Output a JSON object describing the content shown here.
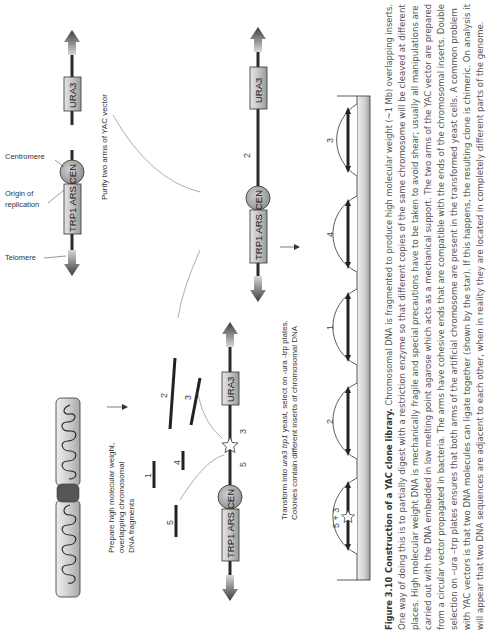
{
  "figure": {
    "caption_label": "Figure 3.10",
    "caption_title": "Construction of a YAC clone library.",
    "caption_lines": [
      "One way of doing this is to partially digest with a restriction enzyme so that different copies of the same chromosome will be cleaved at different",
      "places. High molecular weight DNA is mechanically fragile and special precautions have to be taken to avoid shear; usually all manipulations are",
      "carried out  with the DNA embedded in low melting point agarose which acts as a mechanical support. The two arms of the YAC vector are prepared",
      "from a circular vector propagated in bacteria. The arms have cohesive ends that are compatible with the ends of the chromosomal inserts. Double",
      "selection on –ura  –trp plates ensures that both arms of the artificial chromosome are present in the transformed yeast cells. A common problem",
      "with YAC vectors is that two DNA molecules can ligate together (shown by the star). If this happens, the resulting clone is chimeric. On analysis it",
      "will appear that two DNA sequences are adjacent to each other, when in reality they are located in completely different parts of the genome."
    ],
    "caption_first_line_rest": "Chromosomal DNA is fragmented to produce high molecular weight (~1 Mb) overlapping inserts."
  },
  "labels": {
    "centromere": "Centromere",
    "origin_line1": "Origin of",
    "origin_line2": "replication",
    "telomere": "Telomere",
    "purify": "Purify two arms of YAC vector",
    "prepare_line1": "Prepare high molecular weight,",
    "prepare_line2": "overlapping chromosomal",
    "prepare_line3": "DNA fragments",
    "transform_line1_a": "Transform into ",
    "transform_line1_b": "ura3 trp1",
    "transform_line1_c": " yeast, select on -ura -trp plates.",
    "transform_line2": "Colonies contain different inserts of chromosomal DNA"
  },
  "genes": {
    "ura3": "URA3",
    "trp1_ars": "TRP1 ARS",
    "cen": "CEN"
  },
  "fragments": [
    "1",
    "2",
    "3",
    "4",
    "5"
  ],
  "ligation_labels": {
    "left": "5",
    "right": "3"
  },
  "vector_insert_label": "2",
  "colonies": [
    "5 + 3",
    "2",
    "1",
    "4",
    "3"
  ],
  "colors": {
    "line": "#2a2a2a",
    "box_fill": "#c8c8c8",
    "circle_fill": "#a8a8a8",
    "plate": "#d8d8d8"
  }
}
